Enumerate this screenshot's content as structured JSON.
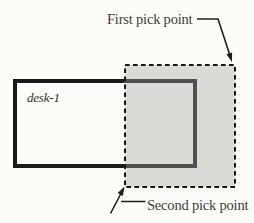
{
  "figure": {
    "labels": {
      "first_pick_point": "First pick point",
      "second_pick_point": "Second pick point",
      "object_name": "desk-1"
    },
    "colors": {
      "background": "#fcfcf9",
      "desk_stroke": "#1b1b1b",
      "desk_stroke_in_selection": "#505050",
      "selection_fill": "#dadad6",
      "selection_stroke": "#161616",
      "leader_stroke": "#1f1f1f",
      "label_text": "#413c36"
    }
  }
}
